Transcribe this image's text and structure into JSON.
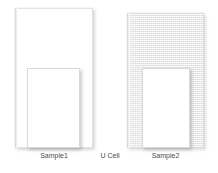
{
  "figure": {
    "background_color": "#ffffff",
    "width": 218,
    "height": 173
  },
  "colors": {
    "slab_white_fill": "#ffffff",
    "slab_grey_fill": "#ededed",
    "border": "#e2e2e2",
    "window_fill": "#ffffff",
    "window_border": "#d9d9d9",
    "caption_text": "#4a4a4a",
    "shadow": "#5a5a5a"
  },
  "captions": {
    "sample1": "Sample1",
    "u_cell": "U Cell",
    "sample2": "Sample2"
  },
  "specimens": [
    {
      "id": "sample1",
      "label": "Sample1",
      "outer_fill": "white",
      "outer": {
        "x": 15,
        "y": 8,
        "w": 78,
        "h": 140
      },
      "window": {
        "x": 27,
        "y": 68,
        "w": 53,
        "h": 80
      }
    },
    {
      "id": "sample2",
      "label": "Sample2",
      "outer_fill": "grey-mesh",
      "outer": {
        "x": 127,
        "y": 13,
        "w": 77,
        "h": 135
      },
      "window": {
        "x": 142,
        "y": 68,
        "w": 48,
        "h": 80
      }
    }
  ],
  "center_annotation": {
    "label": "U Cell",
    "x": 98,
    "y": 151
  }
}
